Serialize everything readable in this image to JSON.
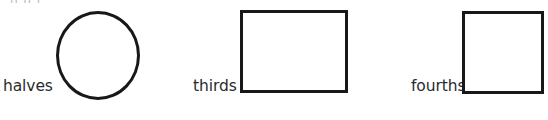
{
  "page": {
    "background_color": "#ffffff",
    "ink_color": "#18181a",
    "text_color": "#2b2b2f",
    "width": 548,
    "height": 120,
    "clipped_top_line": "|| || |"
  },
  "figure": {
    "type": "fraction-shapes-worksheet",
    "items": [
      {
        "label": "halves",
        "shape": "circle",
        "shape_name": "circle-shape",
        "stroke_color": "#18181a",
        "fill_color": "#ffffff"
      },
      {
        "label": "thirds",
        "shape": "rectangle",
        "shape_name": "rectangle-shape",
        "stroke_color": "#18181a",
        "fill_color": "#ffffff"
      },
      {
        "label": "fourths",
        "shape": "square",
        "shape_name": "square-shape",
        "stroke_color": "#18181a",
        "fill_color": "#ffffff"
      }
    ]
  }
}
